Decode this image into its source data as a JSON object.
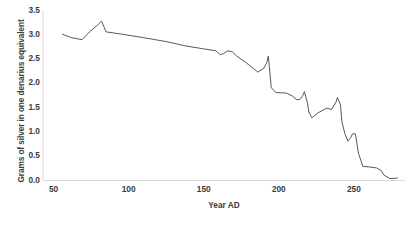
{
  "chart_data": {
    "type": "line",
    "title": "",
    "xlabel": "Year AD",
    "ylabel": "Grams of silver in one denarius equivalent",
    "xlim": [
      43,
      284
    ],
    "ylim": [
      0.0,
      3.5
    ],
    "grid": false,
    "legend": null,
    "line_color": "#595959",
    "line_width": 1.0,
    "axis_color": "#d9d9d9",
    "tick_label_color": "#3c3c3c",
    "x_ticks": [
      50,
      100,
      150,
      200,
      250
    ],
    "x_tick_labels": [
      "50",
      "100",
      "150",
      "200",
      "250"
    ],
    "y_ticks": [
      0.0,
      0.5,
      1.0,
      1.5,
      2.0,
      2.5,
      3.0,
      3.5
    ],
    "y_tick_labels": [
      "0.0",
      "0.5",
      "1.0",
      "1.5",
      "2.0",
      "2.5",
      "3.0",
      "3.5"
    ],
    "series": [
      {
        "name": "Grams of silver in one denarius equivalent",
        "x": [
          56,
          62,
          69,
          74,
          79,
          82,
          85,
          96,
          110,
          125,
          138,
          150,
          158,
          161,
          163,
          166,
          169,
          172,
          178,
          183,
          186,
          190,
          192,
          193,
          195,
          198,
          205,
          209,
          212,
          214,
          216,
          217,
          219,
          220,
          222,
          226,
          230,
          232,
          235,
          238,
          239,
          241,
          242,
          244,
          246,
          248,
          249,
          251,
          253,
          256,
          260,
          265,
          268,
          270,
          274,
          279
        ],
        "y": [
          3.0,
          2.93,
          2.89,
          3.05,
          3.18,
          3.27,
          3.05,
          3.0,
          2.93,
          2.85,
          2.76,
          2.7,
          2.66,
          2.58,
          2.6,
          2.66,
          2.64,
          2.55,
          2.42,
          2.3,
          2.22,
          2.3,
          2.42,
          2.55,
          1.9,
          1.8,
          1.79,
          1.73,
          1.65,
          1.66,
          1.74,
          1.82,
          1.6,
          1.4,
          1.28,
          1.38,
          1.45,
          1.48,
          1.45,
          1.6,
          1.7,
          1.55,
          1.2,
          0.95,
          0.8,
          0.88,
          0.95,
          0.95,
          0.55,
          0.28,
          0.27,
          0.25,
          0.2,
          0.1,
          0.03,
          0.04
        ]
      }
    ]
  },
  "axis_titles": {
    "y": "Grams of silver in one denarius equivalent",
    "x": "Year AD"
  }
}
